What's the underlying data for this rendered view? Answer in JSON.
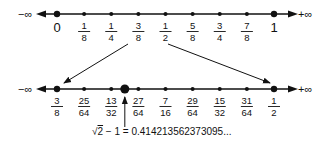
{
  "top_line": {
    "left_label": "−∞",
    "right_label": "+∞",
    "ticks": [
      {
        "kind": "int",
        "text": "0",
        "big": true
      },
      {
        "kind": "frac",
        "num": "1",
        "den": "8"
      },
      {
        "kind": "frac",
        "num": "1",
        "den": "4"
      },
      {
        "kind": "frac",
        "num": "3",
        "den": "8"
      },
      {
        "kind": "frac",
        "num": "1",
        "den": "2"
      },
      {
        "kind": "frac",
        "num": "5",
        "den": "8"
      },
      {
        "kind": "frac",
        "num": "3",
        "den": "4"
      },
      {
        "kind": "frac",
        "num": "7",
        "den": "8"
      },
      {
        "kind": "int",
        "text": "1",
        "big": true
      }
    ]
  },
  "bottom_line": {
    "left_label": "−∞",
    "right_label": "+∞",
    "ticks": [
      {
        "kind": "frac",
        "num": "3",
        "den": "8",
        "big": true
      },
      {
        "kind": "frac",
        "num": "25",
        "den": "64"
      },
      {
        "kind": "frac",
        "num": "13",
        "den": "32"
      },
      {
        "kind": "frac",
        "num": "27",
        "den": "64"
      },
      {
        "kind": "frac",
        "num": "7",
        "den": "16"
      },
      {
        "kind": "frac",
        "num": "29",
        "den": "64"
      },
      {
        "kind": "frac",
        "num": "15",
        "den": "32"
      },
      {
        "kind": "frac",
        "num": "31",
        "den": "64"
      },
      {
        "kind": "frac",
        "num": "1",
        "den": "2",
        "big": true
      }
    ],
    "highlight_between": [
      2,
      3
    ]
  },
  "annotation": {
    "sqrt_symbol": "√",
    "radicand": "2",
    "text": " − 1 = 0.414213562373095..."
  }
}
